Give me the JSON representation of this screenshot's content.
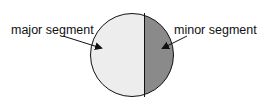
{
  "diagram": {
    "labels": {
      "major": "major segment",
      "minor": "minor segment"
    },
    "colors": {
      "major_fill": "#ededed",
      "minor_fill": "#8a8a8a",
      "stroke": "#111111"
    }
  }
}
